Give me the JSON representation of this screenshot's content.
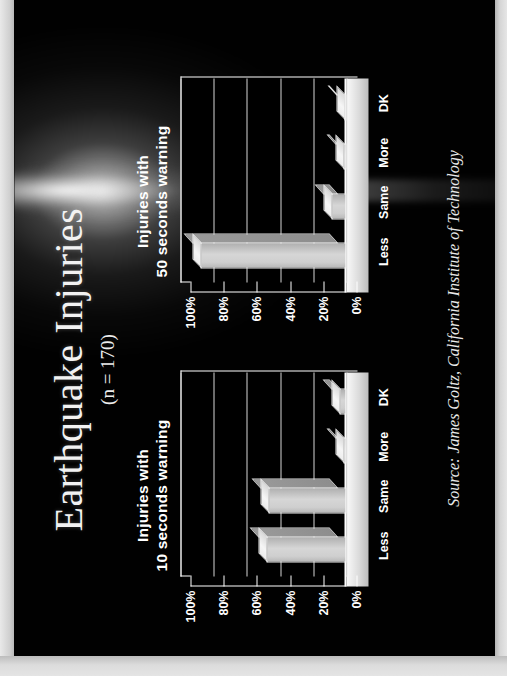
{
  "slide": {
    "title": "Earthquake Injuries",
    "sample_note": "(n = 170)",
    "source": "Source:  James Goltz, California Institute of Technology",
    "background_color": "#000000",
    "text_color": "#ffffff",
    "bar_color": "#d0d0d0"
  },
  "charts": [
    {
      "title_line1": "Injuries with",
      "title_line2": "10 seconds warning",
      "categories": [
        "Less",
        "Same",
        "More",
        "DK"
      ],
      "values": [
        48,
        47,
        2,
        4
      ],
      "ytick_labels": [
        "100%",
        "80%",
        "60%",
        "40%",
        "20%",
        "0%"
      ],
      "ytick_values": [
        100,
        80,
        60,
        40,
        20,
        0
      ]
    },
    {
      "title_line1": "Injuries with",
      "title_line2": "50 seconds warning",
      "categories": [
        "Less",
        "Same",
        "More",
        "DK"
      ],
      "values": [
        88,
        9,
        2,
        1
      ],
      "ytick_labels": [
        "100%",
        "80%",
        "60%",
        "40%",
        "20%",
        "0%"
      ],
      "ytick_values": [
        100,
        80,
        60,
        40,
        20,
        0
      ]
    }
  ],
  "chart_data": [
    {
      "type": "bar",
      "title": "Injuries with 10 seconds warning",
      "categories": [
        "Less",
        "Same",
        "More",
        "DK"
      ],
      "values": [
        48,
        47,
        2,
        4
      ],
      "xlabel": "",
      "ylabel": "",
      "ylim": [
        0,
        100
      ],
      "ytick_labels": [
        "0%",
        "20%",
        "40%",
        "60%",
        "80%",
        "100%"
      ],
      "grid": true,
      "legend": "none",
      "annotation": "n = 170"
    },
    {
      "type": "bar",
      "title": "Injuries with 50 seconds warning",
      "categories": [
        "Less",
        "Same",
        "More",
        "DK"
      ],
      "values": [
        88,
        9,
        2,
        1
      ],
      "xlabel": "",
      "ylabel": "",
      "ylim": [
        0,
        100
      ],
      "ytick_labels": [
        "0%",
        "20%",
        "40%",
        "60%",
        "80%",
        "100%"
      ],
      "grid": true,
      "legend": "none",
      "annotation": "n = 170"
    }
  ]
}
